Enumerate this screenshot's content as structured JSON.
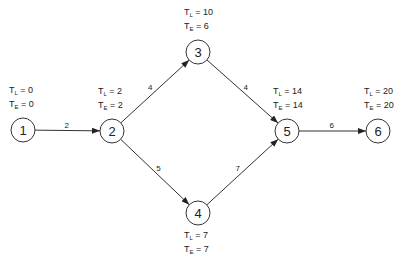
{
  "diagram": {
    "type": "network-activity-diagram",
    "nodes": [
      {
        "id": "1",
        "label": "1",
        "x": 23,
        "y": 130,
        "TL": "0",
        "TE": "0"
      },
      {
        "id": "2",
        "label": "2",
        "x": 112,
        "y": 131,
        "TL": "2",
        "TE": "2"
      },
      {
        "id": "3",
        "label": "3",
        "x": 198,
        "y": 52,
        "TL": "10",
        "TE": "6"
      },
      {
        "id": "4",
        "label": "4",
        "x": 198,
        "y": 213,
        "TL": "7",
        "TE": "7"
      },
      {
        "id": "5",
        "label": "5",
        "x": 287,
        "y": 131,
        "TL": "14",
        "TE": "14"
      },
      {
        "id": "6",
        "label": "6",
        "x": 378,
        "y": 131,
        "TL": "20",
        "TE": "20"
      }
    ],
    "edges": [
      {
        "from": "1",
        "to": "2",
        "weight": "2"
      },
      {
        "from": "2",
        "to": "3",
        "weight": "4"
      },
      {
        "from": "2",
        "to": "4",
        "weight": "5"
      },
      {
        "from": "3",
        "to": "5",
        "weight": "4"
      },
      {
        "from": "4",
        "to": "5",
        "weight": "7"
      },
      {
        "from": "5",
        "to": "6",
        "weight": "6"
      }
    ],
    "labels": {
      "tl_prefix": "T",
      "tl_sub": "L",
      "te_prefix": "T",
      "te_sub": "E",
      "eq": " = "
    }
  }
}
